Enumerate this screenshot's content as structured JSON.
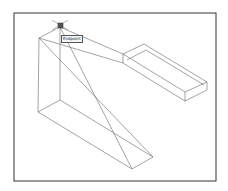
{
  "viewport": {
    "background": "#ffffff",
    "frame_color": "#333333",
    "line_color": "#666666"
  },
  "osnap": {
    "tooltip_label": "Endpoint",
    "marker_color": "#444444"
  },
  "objects": [
    {
      "name": "large-wedge-wireframe"
    },
    {
      "name": "small-box-wireframe"
    }
  ]
}
